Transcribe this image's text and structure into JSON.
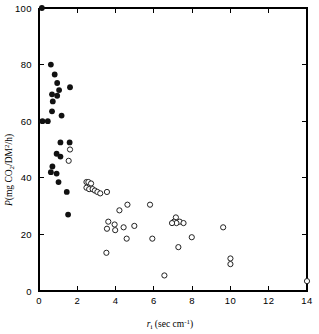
{
  "chart_data": {
    "type": "scatter",
    "title": "",
    "xlabel": "rᵢ (sec cm⁻¹)",
    "ylabel": "P(mg CO₂/DM²/h)",
    "xlim": [
      0,
      14
    ],
    "ylim": [
      0,
      100
    ],
    "xticks": [
      0,
      2,
      4,
      6,
      8,
      10,
      12,
      14
    ],
    "xticklabels": [
      "0",
      "2",
      "4",
      "6",
      "8",
      "10",
      "12",
      "14"
    ],
    "yticks": [
      0,
      20,
      40,
      60,
      80,
      100
    ],
    "yticklabels": [
      "0",
      "20",
      "40",
      "60",
      "80",
      "100"
    ],
    "grid": false,
    "legend": false,
    "series": [
      {
        "name": "filled-circles",
        "marker": "filled-circle",
        "color": "#111111",
        "points": [
          [
            0.15,
            100.0
          ],
          [
            0.62,
            80.0
          ],
          [
            0.82,
            76.5
          ],
          [
            0.95,
            73.5
          ],
          [
            1.05,
            71.0
          ],
          [
            1.62,
            72.0
          ],
          [
            0.68,
            69.5
          ],
          [
            0.95,
            69.0
          ],
          [
            0.72,
            67.0
          ],
          [
            0.68,
            63.5
          ],
          [
            1.18,
            62.0
          ],
          [
            0.18,
            60.0
          ],
          [
            0.46,
            60.0
          ],
          [
            1.12,
            52.5
          ],
          [
            1.6,
            52.5
          ],
          [
            1.12,
            47.5
          ],
          [
            0.92,
            48.5
          ],
          [
            0.7,
            44.0
          ],
          [
            0.62,
            42.0
          ],
          [
            0.92,
            41.5
          ],
          [
            1.02,
            38.5
          ],
          [
            1.45,
            35.0
          ],
          [
            1.52,
            27.0
          ]
        ]
      },
      {
        "name": "open-circles",
        "marker": "open-circle",
        "color": "#ffffff",
        "points": [
          [
            1.62,
            50.0
          ],
          [
            1.55,
            46.0
          ],
          [
            2.48,
            38.5
          ],
          [
            2.58,
            38.5
          ],
          [
            2.72,
            38.0
          ],
          [
            2.48,
            36.5
          ],
          [
            2.62,
            36.0
          ],
          [
            2.8,
            36.0
          ],
          [
            2.92,
            35.5
          ],
          [
            3.05,
            35.0
          ],
          [
            3.2,
            34.5
          ],
          [
            3.55,
            35.0
          ],
          [
            4.62,
            30.5
          ],
          [
            4.2,
            28.5
          ],
          [
            5.8,
            30.5
          ],
          [
            3.62,
            24.5
          ],
          [
            3.55,
            22.0
          ],
          [
            3.95,
            23.5
          ],
          [
            3.98,
            21.5
          ],
          [
            4.42,
            22.5
          ],
          [
            4.98,
            23.0
          ],
          [
            7.15,
            26.0
          ],
          [
            7.05,
            24.5
          ],
          [
            7.35,
            24.5
          ],
          [
            7.18,
            24.0
          ],
          [
            6.95,
            24.0
          ],
          [
            7.55,
            24.0
          ],
          [
            4.58,
            18.5
          ],
          [
            5.92,
            18.5
          ],
          [
            7.98,
            19.0
          ],
          [
            3.52,
            13.5
          ],
          [
            7.28,
            15.5
          ],
          [
            9.62,
            22.5
          ],
          [
            10.0,
            11.5
          ],
          [
            10.0,
            9.5
          ],
          [
            6.55,
            5.5
          ],
          [
            14.0,
            3.5
          ]
        ]
      }
    ]
  },
  "axes": {
    "x_axis_name": "r-i-axis",
    "y_axis_name": "P-axis"
  }
}
